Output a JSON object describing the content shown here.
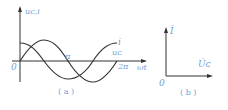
{
  "diagram_a": {
    "y_axis_label": "uᴄ,i",
    "x_axis_label": "ωt",
    "origin_label": "0",
    "tick_pi": "π",
    "tick_2pi": "2π",
    "curve_i_label": "i",
    "curve_uc_label": "uᴄ",
    "caption": "( a )",
    "curves": [
      {
        "name": "i",
        "function": "cos",
        "phase_lead_deg": 90
      },
      {
        "name": "u_C",
        "function": "sin",
        "phase_lead_deg": 0
      }
    ]
  },
  "diagram_b": {
    "origin_label": "0",
    "phasor_i_label": "İ",
    "phasor_uc_label": "U̇ᴄ",
    "caption": "( b )",
    "angle_between_deg": 90
  },
  "colors": {
    "line": "#333333",
    "label": "#6f9fd8"
  }
}
